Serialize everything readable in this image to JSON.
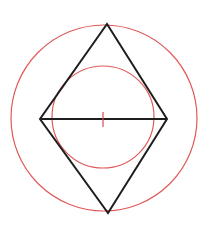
{
  "diagram": {
    "canvas": {
      "width": 218,
      "height": 226,
      "background": "#ffffff"
    },
    "colors": {
      "circle": "#e05a5a",
      "rhombus": "#1e1e1e",
      "tick": "#d94a4a"
    },
    "outer_circle": {
      "cx": 104,
      "cy": 118,
      "r": 93
    },
    "inner_circle": {
      "cx": 103,
      "cy": 117,
      "r": 51
    },
    "rhombus": {
      "top": [
        107,
        24
      ],
      "right": [
        167,
        119
      ],
      "bottom": [
        108,
        213
      ],
      "left": [
        40,
        119
      ]
    },
    "diagonal": {
      "x1": 40,
      "y1": 119,
      "x2": 167,
      "y2": 119
    },
    "center_tick": {
      "x": 103,
      "y1": 112,
      "y2": 127
    }
  }
}
